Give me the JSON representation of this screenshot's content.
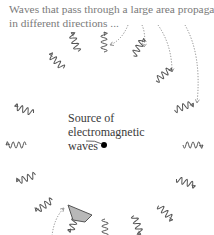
{
  "caption": {
    "line1": "Waves that pass through a large area propagate",
    "line2": "in different directions ..."
  },
  "source_label": {
    "line1": "Source of",
    "line2": "electromagnetic",
    "line3": "waves"
  },
  "colors": {
    "wave_stroke": "#555555",
    "caption_text": "#7a7a7a",
    "source_text": "#3a3a3a",
    "dotted_arrow": "#8a8a8a",
    "detector_fill": "#b8b8b8",
    "source_dot": "#000000"
  },
  "source_point": {
    "x": 104,
    "y": 145
  },
  "waves": [
    {
      "id": "w-top-left-far",
      "x": 57,
      "y": 62,
      "angle": 225
    },
    {
      "id": "w-top-left",
      "x": 75,
      "y": 43,
      "angle": 250
    },
    {
      "id": "w-top",
      "x": 104,
      "y": 43,
      "angle": 270
    },
    {
      "id": "w-top-right",
      "x": 138,
      "y": 48,
      "angle": 300
    },
    {
      "id": "w-upper-right",
      "x": 163,
      "y": 75,
      "angle": 320
    },
    {
      "id": "w-right-upper",
      "x": 183,
      "y": 107,
      "angle": 340
    },
    {
      "id": "w-right",
      "x": 192,
      "y": 145,
      "angle": 0
    },
    {
      "id": "w-right-lower",
      "x": 185,
      "y": 182,
      "angle": 20
    },
    {
      "id": "w-lower-right",
      "x": 165,
      "y": 212,
      "angle": 45
    },
    {
      "id": "w-bottom-right",
      "x": 137,
      "y": 224,
      "angle": 70
    },
    {
      "id": "w-bottom",
      "x": 105,
      "y": 228,
      "angle": 90
    },
    {
      "id": "w-bottom-left",
      "x": 74,
      "y": 222,
      "angle": 110
    },
    {
      "id": "w-lower-left",
      "x": 45,
      "y": 205,
      "angle": 145
    },
    {
      "id": "w-left-lower",
      "x": 27,
      "y": 178,
      "angle": 160
    },
    {
      "id": "w-left",
      "x": 17,
      "y": 145,
      "angle": 180
    },
    {
      "id": "w-left-upper",
      "x": 25,
      "y": 110,
      "angle": 200
    }
  ],
  "dotted_arrows": [
    {
      "id": "arrow-to-top",
      "path": "M128 25 Q122 40 110 45"
    },
    {
      "id": "arrow-to-top-right",
      "path": "M142 25 Q146 34 144 47"
    },
    {
      "id": "arrow-to-upper-right",
      "path": "M158 25 Q172 45 172 72"
    },
    {
      "id": "arrow-to-right-upper",
      "path": "M185 25 Q202 55 197 103"
    },
    {
      "id": "arrow-to-detector",
      "path": "M52 236 Q54 218 64 208"
    }
  ],
  "detector": {
    "points": "68,205 92,215 85,222 73,220"
  }
}
